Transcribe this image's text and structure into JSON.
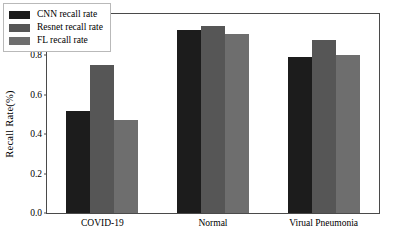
{
  "chart_data": {
    "type": "bar",
    "title": "",
    "xlabel": "",
    "ylabel": "Recall Rate(%)",
    "categories": [
      "COVID-19",
      "Normal",
      "Virual Pneumonia"
    ],
    "series": [
      {
        "name": "CNN recall rate",
        "values": [
          0.52,
          0.93,
          0.79
        ],
        "color": "#1c1c1c"
      },
      {
        "name": "Resnet recall rate",
        "values": [
          0.75,
          0.95,
          0.88
        ],
        "color": "#565656"
      },
      {
        "name": "FL recall rate",
        "values": [
          0.47,
          0.91,
          0.8
        ],
        "color": "#6e6e6e"
      }
    ],
    "ylim": [
      0.0,
      1.01
    ],
    "yticks": [
      0.0,
      0.2,
      0.4,
      0.6,
      0.8
    ],
    "ytick_labels": [
      "0.0",
      "0.2",
      "0.4",
      "0.6",
      "0.8"
    ],
    "grid": false,
    "legend_position": "upper left",
    "frame": true
  }
}
